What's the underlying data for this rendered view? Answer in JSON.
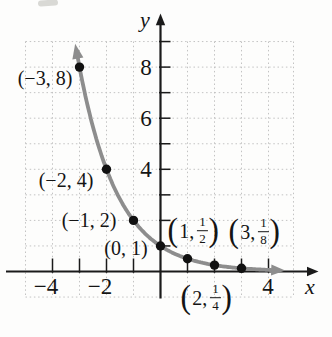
{
  "labels": {
    "paren_open": "(",
    "paren_close": ")"
  },
  "chart_data": {
    "type": "line",
    "title": "",
    "function_base": 0.5,
    "points": [
      {
        "x": -3,
        "y": 8,
        "label": "(−3, 8)"
      },
      {
        "x": -2,
        "y": 4,
        "label": "(−2, 4)"
      },
      {
        "x": -1,
        "y": 2,
        "label": "(−1, 2)"
      },
      {
        "x": 0,
        "y": 1,
        "label": "(0, 1)"
      },
      {
        "x": 1,
        "y": 0.5,
        "label": "(1, 1/2)",
        "pre": "1,",
        "num": "1",
        "den": "2"
      },
      {
        "x": 2,
        "y": 0.25,
        "label": "(2, 1/4)",
        "pre": "2,",
        "num": "1",
        "den": "4"
      },
      {
        "x": 3,
        "y": 0.125,
        "label": "(3, 1/8)",
        "pre": "3,",
        "num": "1",
        "den": "8"
      }
    ],
    "x_axis": {
      "label": "x",
      "range": [
        -5,
        5
      ],
      "tick_step": 1,
      "tick_labels": [
        "−4",
        "−2",
        "4"
      ],
      "tick_label_values": [
        -4,
        -2,
        4
      ]
    },
    "y_axis": {
      "label": "y",
      "range": [
        -1,
        9
      ],
      "tick_step": 1,
      "tick_labels": [
        "8",
        "6",
        "4"
      ],
      "tick_label_values": [
        8,
        6,
        4
      ]
    },
    "grid": {
      "show": true,
      "style": "dotted",
      "color": "#c3c3c3"
    },
    "colors": {
      "curve": "#8d8d8d",
      "points": "#111111",
      "axes": "#1a1a1a",
      "text": "#141414"
    },
    "legend": null
  }
}
